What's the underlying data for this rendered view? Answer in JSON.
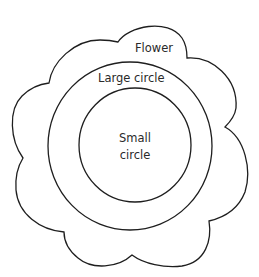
{
  "diagram": {
    "type": "nested-shapes",
    "colors": {
      "stroke": "#1e1e1e",
      "text": "#2a2a2a",
      "background": "#ffffff"
    },
    "shapes": [
      {
        "id": "flower",
        "label": "Flower"
      },
      {
        "id": "large_circle",
        "label": "Large circle"
      },
      {
        "id": "small_circle",
        "label_line1": "Small",
        "label_line2": "circle"
      }
    ]
  },
  "labels": {
    "flower": "Flower",
    "large_circle": "Large circle",
    "small_circle_line1": "Small",
    "small_circle_line2": "circle"
  }
}
